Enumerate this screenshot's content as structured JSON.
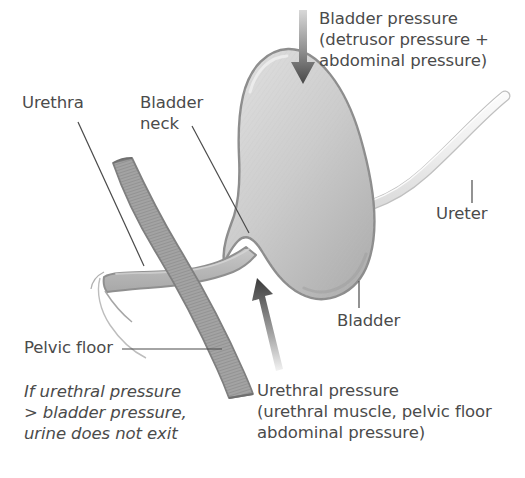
{
  "figure": {
    "background_color": "#ffffff",
    "text_color": "#4b4b4b"
  },
  "labels": {
    "bladder_pressure": "Bladder pressure\n(detrusor pressure +\nabdominal pressure)",
    "urethra": "Urethra",
    "bladder_neck": "Bladder\nneck",
    "ureter": "Ureter",
    "bladder": "Bladder",
    "pelvic_floor": "Pelvic floor",
    "urethral_pressure": "Urethral pressure\n(urethral muscle, pelvic floor\nabdominal pressure)"
  },
  "caption": {
    "pressure_rule": "If urethral pressure\n> bladder pressure,\nurine does not exit"
  },
  "anatomy": {
    "bladder": {
      "name": "bladder",
      "fill_light": "#d6d6d6",
      "fill_dark": "#b4b4b4",
      "stroke": "#8c8c8c"
    },
    "urethra": {
      "name": "urethra",
      "fill": "#bcbcbc",
      "stroke": "#8f8f8f"
    },
    "pelvic_floor": {
      "name": "pelvic-floor",
      "fill": "#a0a0a0",
      "stroke": "#7d7d7d",
      "texture": "striated"
    },
    "ureter": {
      "name": "ureter",
      "fill": "#f0f0f0",
      "stroke": "#b9b9b9"
    }
  },
  "arrows": {
    "bladder_pressure": {
      "name": "bladder-pressure-arrow",
      "direction": "down",
      "gradient_from": "#d2d2d2",
      "gradient_to": "#4a4a4a"
    },
    "urethral_pressure": {
      "name": "urethral-pressure-arrow",
      "direction": "up",
      "gradient_from": "#eeeeee",
      "gradient_to": "#3d3d3d"
    }
  },
  "leader_lines": {
    "color": "#4a4a4a"
  }
}
